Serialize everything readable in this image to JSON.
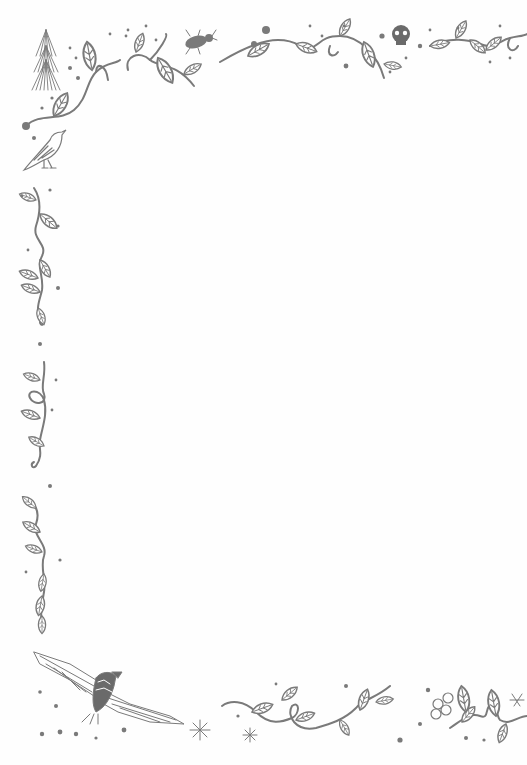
{
  "page": {
    "type": "decorative-stationery",
    "ink_color": "#7a7a7a",
    "paper_color": "#fefefe",
    "motifs": [
      "pine-tree",
      "vine-leaves",
      "beetle",
      "skull",
      "songbird",
      "eagle",
      "snowflake",
      "butterfly",
      "flower",
      "dots"
    ]
  }
}
